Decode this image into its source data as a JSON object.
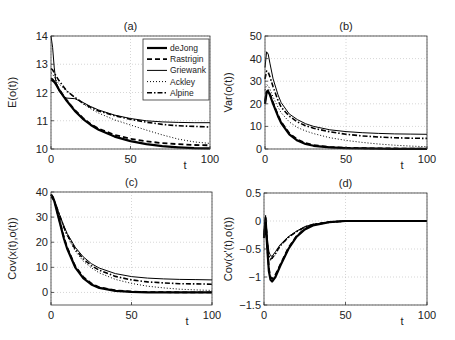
{
  "chart_data": [
    {
      "type": "line",
      "title": "(a)",
      "xlabel": "t",
      "ylabel": "E(o(t))",
      "xlim": [
        0,
        100
      ],
      "ylim": [
        10,
        14
      ],
      "xticks": [
        "0",
        "50",
        "100"
      ],
      "yticks": [
        "10",
        "11",
        "12",
        "13",
        "14"
      ],
      "grid": true,
      "legend_position": "top-right",
      "x": [
        0,
        1,
        2,
        3,
        5,
        8,
        10,
        15,
        20,
        25,
        30,
        40,
        50,
        60,
        70,
        80,
        90,
        100
      ],
      "series": [
        {
          "name": "deJong",
          "style": "solid-thick",
          "values": [
            12.45,
            12.42,
            12.38,
            12.3,
            12.1,
            11.85,
            11.7,
            11.35,
            11.07,
            10.85,
            10.68,
            10.44,
            10.28,
            10.17,
            10.1,
            10.06,
            10.03,
            10.02
          ]
        },
        {
          "name": "Rastrigin",
          "style": "dashed",
          "values": [
            12.5,
            12.47,
            12.4,
            12.32,
            12.12,
            11.87,
            11.72,
            11.38,
            11.1,
            10.88,
            10.72,
            10.5,
            10.36,
            10.27,
            10.21,
            10.17,
            10.14,
            10.13
          ]
        },
        {
          "name": "Griewank",
          "style": "solid-thin",
          "values": [
            14.0,
            13.6,
            12.9,
            12.4,
            12.05,
            11.85,
            11.8,
            11.78,
            11.65,
            11.5,
            11.38,
            11.2,
            11.08,
            11.0,
            10.96,
            10.94,
            10.93,
            10.93
          ]
        },
        {
          "name": "Ackley",
          "style": "dotted",
          "values": [
            12.7,
            12.65,
            12.55,
            12.45,
            12.3,
            12.15,
            12.05,
            11.82,
            11.6,
            11.42,
            11.27,
            11.03,
            10.85,
            10.67,
            10.5,
            10.35,
            10.25,
            10.2
          ]
        },
        {
          "name": "Alpine",
          "style": "dash-dot",
          "values": [
            12.85,
            12.8,
            12.7,
            12.6,
            12.42,
            12.2,
            12.05,
            11.83,
            11.63,
            11.47,
            11.35,
            11.18,
            11.05,
            10.95,
            10.87,
            10.82,
            10.8,
            10.78
          ]
        }
      ]
    },
    {
      "type": "line",
      "title": "(b)",
      "xlabel": "t",
      "ylabel": "Var(o(t))",
      "xlim": [
        0,
        100
      ],
      "ylim": [
        0,
        50
      ],
      "xticks": [
        "0",
        "50",
        "100"
      ],
      "yticks": [
        "0",
        "10",
        "20",
        "30",
        "40",
        "50"
      ],
      "grid": true,
      "x": [
        0,
        1,
        2,
        3,
        5,
        8,
        10,
        15,
        20,
        25,
        30,
        40,
        50,
        60,
        70,
        80,
        90,
        100
      ],
      "series": [
        {
          "name": "deJong",
          "style": "solid-thick",
          "values": [
            20,
            25,
            25.5,
            24,
            20,
            14.5,
            11.5,
            6.5,
            3.7,
            2.2,
            1.4,
            0.7,
            0.4,
            0.25,
            0.15,
            0.1,
            0.08,
            0.05
          ]
        },
        {
          "name": "Rastrigin",
          "style": "dashed",
          "values": [
            21,
            25.5,
            26,
            24.5,
            20.5,
            15,
            12,
            7,
            4.2,
            2.6,
            1.7,
            0.9,
            0.55,
            0.35,
            0.25,
            0.2,
            0.15,
            0.12
          ]
        },
        {
          "name": "Griewank",
          "style": "solid-thin",
          "values": [
            36,
            43,
            42,
            38,
            31,
            24,
            20.5,
            15.5,
            13,
            11.2,
            10,
            8.5,
            7.7,
            7.2,
            6.9,
            6.7,
            6.6,
            6.5
          ]
        },
        {
          "name": "Ackley",
          "style": "dotted",
          "values": [
            26,
            28.5,
            28,
            26.5,
            23,
            18.5,
            16,
            12,
            9.5,
            8,
            6.8,
            5,
            3.8,
            2.9,
            2.2,
            1.7,
            1.3,
            1.0
          ]
        },
        {
          "name": "Alpine",
          "style": "dash-dot",
          "values": [
            31,
            34.5,
            34,
            32,
            27.5,
            21.5,
            18.5,
            14.5,
            12,
            10.3,
            9.2,
            7.6,
            6.5,
            5.8,
            5.3,
            5.0,
            4.8,
            4.7
          ]
        }
      ]
    },
    {
      "type": "line",
      "title": "(c)",
      "xlabel": "t",
      "ylabel": "Cov(x(t),o(t))",
      "xlim": [
        0,
        100
      ],
      "ylim": [
        -5,
        40
      ],
      "xticks": [
        "0",
        "50",
        "100"
      ],
      "yticks": [
        "0",
        "10",
        "20",
        "30",
        "40"
      ],
      "grid": true,
      "x": [
        0,
        1,
        2,
        3,
        5,
        8,
        10,
        15,
        20,
        25,
        30,
        40,
        50,
        60,
        70,
        80,
        90,
        100
      ],
      "series": [
        {
          "name": "deJong",
          "style": "solid-thick",
          "values": [
            39,
            38,
            36.5,
            34,
            29,
            21.5,
            17.5,
            10,
            5.7,
            3.2,
            1.8,
            0.6,
            0.2,
            0.05,
            0,
            0,
            0,
            0
          ]
        },
        {
          "name": "Rastrigin",
          "style": "dashed",
          "values": [
            39,
            38.2,
            36.8,
            34.5,
            29.5,
            22,
            18,
            10.5,
            6.2,
            3.6,
            2.1,
            0.8,
            0.35,
            0.15,
            0.08,
            0.05,
            0.03,
            0.02
          ]
        },
        {
          "name": "Griewank",
          "style": "solid-thin",
          "values": [
            38,
            37.5,
            36.5,
            35,
            31.5,
            26.5,
            23.5,
            18,
            14.2,
            11.5,
            9.7,
            7.5,
            6.3,
            5.7,
            5.4,
            5.2,
            5.1,
            5.0
          ]
        },
        {
          "name": "Ackley",
          "style": "dotted",
          "values": [
            38,
            37.5,
            36.5,
            34.8,
            31,
            25.5,
            22.5,
            16.5,
            12.5,
            9.8,
            7.8,
            5.2,
            3.6,
            2.5,
            1.8,
            1.3,
            1.0,
            0.8
          ]
        },
        {
          "name": "Alpine",
          "style": "dash-dot",
          "values": [
            38,
            37.5,
            36.5,
            35,
            31.3,
            26,
            23,
            17.3,
            13.4,
            10.7,
            8.8,
            6.4,
            5.0,
            4.2,
            3.8,
            3.5,
            3.4,
            3.3
          ]
        }
      ]
    },
    {
      "type": "line",
      "title": "(d)",
      "xlabel": "t",
      "ylabel": "Cov(x'(t),o(t))",
      "xlim": [
        0,
        100
      ],
      "ylim": [
        -1.5,
        0.5
      ],
      "xticks": [
        "0",
        "50",
        "100"
      ],
      "yticks": [
        "-1.5",
        "-1",
        "-0.5",
        "0",
        "0.5"
      ],
      "grid": true,
      "x": [
        0,
        1,
        2,
        3,
        4,
        5,
        7,
        10,
        15,
        20,
        25,
        30,
        40,
        50,
        60,
        70,
        80,
        90,
        100
      ],
      "series": [
        {
          "name": "deJong",
          "style": "solid-thick",
          "values": [
            -0.3,
            0.05,
            -0.5,
            -0.9,
            -1.05,
            -1.08,
            -1.0,
            -0.8,
            -0.5,
            -0.28,
            -0.15,
            -0.08,
            -0.02,
            0,
            0,
            0,
            0,
            0,
            0
          ]
        },
        {
          "name": "Rastrigin",
          "style": "dashed",
          "values": [
            -0.3,
            0.0,
            -0.45,
            -0.85,
            -1.0,
            -1.03,
            -0.96,
            -0.78,
            -0.48,
            -0.27,
            -0.14,
            -0.07,
            -0.02,
            0,
            0,
            0,
            0,
            0,
            0
          ]
        },
        {
          "name": "Griewank",
          "style": "solid-thin",
          "values": [
            -0.2,
            0.1,
            -0.3,
            -0.55,
            -0.62,
            -0.63,
            -0.55,
            -0.42,
            -0.28,
            -0.18,
            -0.1,
            -0.06,
            -0.02,
            0,
            0,
            0,
            0,
            0,
            0
          ]
        },
        {
          "name": "Ackley",
          "style": "dotted",
          "values": [
            -0.3,
            -0.1,
            -0.45,
            -0.65,
            -0.7,
            -0.68,
            -0.6,
            -0.45,
            -0.3,
            -0.19,
            -0.11,
            -0.06,
            -0.02,
            0,
            0,
            0,
            0,
            0,
            0
          ]
        },
        {
          "name": "Alpine",
          "style": "dash-dot",
          "values": [
            -0.25,
            0.0,
            -0.4,
            -0.62,
            -0.68,
            -0.66,
            -0.58,
            -0.44,
            -0.29,
            -0.19,
            -0.11,
            -0.06,
            -0.02,
            0,
            0,
            0,
            0,
            0,
            0
          ]
        }
      ]
    }
  ],
  "legend": {
    "entries": [
      "deJong",
      "Rastrigin",
      "Griewank",
      "Ackley",
      "Alpine"
    ]
  }
}
